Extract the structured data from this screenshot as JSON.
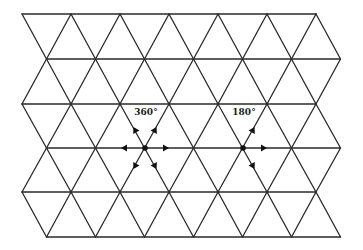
{
  "diagram": {
    "type": "triangular-lattice",
    "line_color": "#2a2a2a",
    "grid": {
      "rows_y": [
        14,
        59,
        104,
        148,
        192,
        237
      ],
      "even_row_x_start": 22,
      "odd_row_x_start": 46.5,
      "x_spacing": 49,
      "vertices_per_row": 7
    },
    "centers": [
      {
        "id": "rotation-360",
        "label": "360°",
        "x": 145,
        "y": 148,
        "label_x": 146,
        "label_y": 115,
        "arrows": [
          "up-left",
          "up-right",
          "left",
          "right",
          "down-left",
          "down-right"
        ]
      },
      {
        "id": "rotation-180",
        "label": "180°",
        "x": 243,
        "y": 148,
        "label_x": 244,
        "label_y": 115,
        "arrows": [
          "up-right",
          "right",
          "down-right"
        ]
      }
    ]
  }
}
